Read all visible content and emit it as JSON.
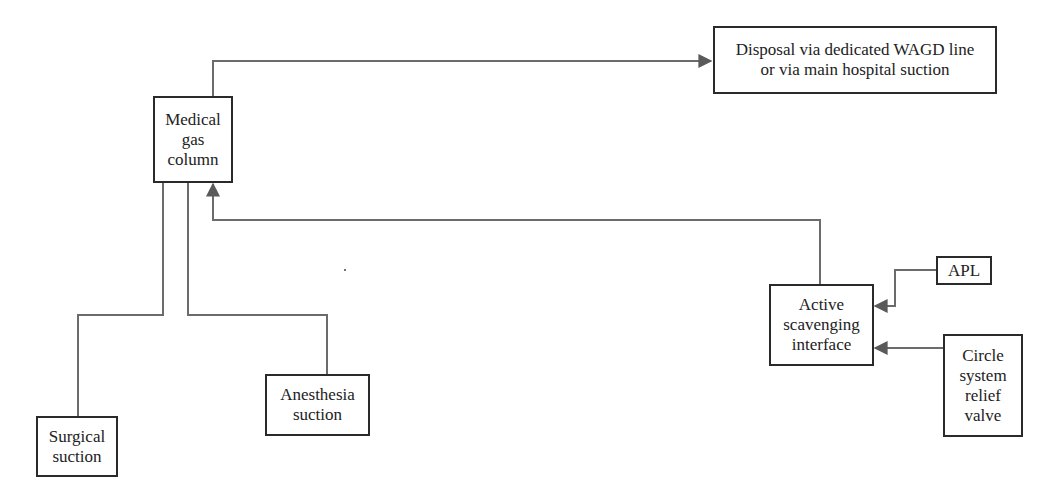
{
  "diagram": {
    "type": "flowchart",
    "line_color": "#6b6b6b",
    "border_color": "#2a2a2a",
    "nodes": {
      "medical_gas_column": {
        "label": "Medical\ngas\ncolumn"
      },
      "disposal": {
        "label": "Disposal via dedicated WAGD line\nor via main hospital suction"
      },
      "surgical_suction": {
        "label": "Surgical\nsuction"
      },
      "anesthesia_suction": {
        "label": "Anesthesia\nsuction"
      },
      "active_scavenging_interface": {
        "label": "Active\nscavenging\ninterface"
      },
      "apl": {
        "label": "APL"
      },
      "circle_system_relief_valve": {
        "label": "Circle\nsystem\nrelief\nvalve"
      }
    },
    "edges": [
      {
        "from": "medical_gas_column",
        "to": "disposal",
        "arrow": true
      },
      {
        "from": "active_scavenging_interface",
        "to": "medical_gas_column",
        "arrow": true
      },
      {
        "from": "apl",
        "to": "active_scavenging_interface",
        "arrow": true
      },
      {
        "from": "circle_system_relief_valve",
        "to": "active_scavenging_interface",
        "arrow": true
      },
      {
        "from": "medical_gas_column",
        "to": "surgical_suction",
        "arrow": false
      },
      {
        "from": "medical_gas_column",
        "to": "anesthesia_suction",
        "arrow": false
      }
    ]
  }
}
